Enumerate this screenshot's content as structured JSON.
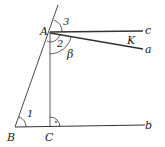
{
  "diagram": {
    "points": {
      "A": "A",
      "B": "B",
      "C": "C"
    },
    "rays": {
      "a": "a",
      "b": "b",
      "c": "c"
    },
    "angles": {
      "one": "1",
      "two": "2",
      "three": "3",
      "beta": "β"
    },
    "intersection": "K",
    "right_angle_mark": "·"
  }
}
